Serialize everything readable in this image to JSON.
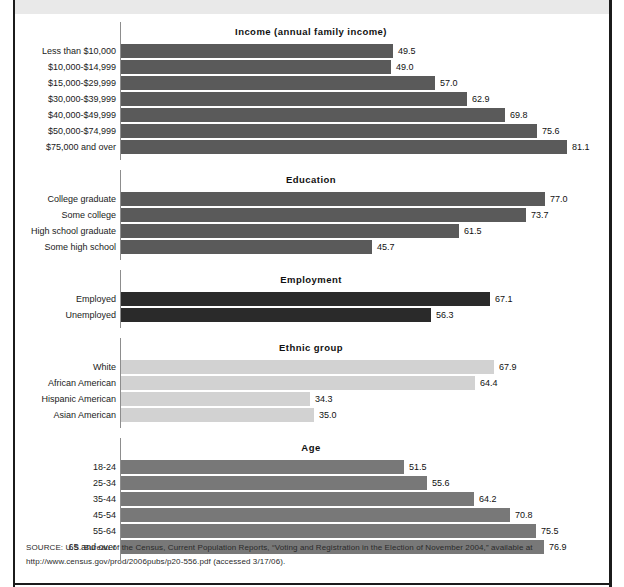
{
  "figure": {
    "top_band_text": "",
    "source": "SOURCE: U.S. Bureau of the Census, Current Population Reports, “Voting and Registration in the Election of November 2004,” available at http://www.census.gov/prod/2006pubs/p20-556.pdf (accessed 3/17/06)."
  },
  "colors": {
    "bar_income": "#5a5a5a",
    "bar_education": "#5a5a5a",
    "bar_employment": "#2a2a2a",
    "bar_ethnic": "#d2d2d2",
    "bar_age": "#787878",
    "axis": "#8d8d8d",
    "text": "#111111",
    "frame": "#1b1b1b",
    "top_band": "#e9e9e9"
  },
  "chart_data": {
    "type": "bar",
    "orientation": "horizontal",
    "title": "",
    "xlabel": "",
    "ylabel": "",
    "xlim": [
      0,
      90
    ],
    "grid": false,
    "legend": "none",
    "value_suffix": "",
    "groups": [
      {
        "name": "income",
        "title": "Income (annual family income)",
        "color": "#5a5a5a",
        "categories": [
          "Less than $10,000",
          "$10,000-$14,999",
          "$15,000-$29,999",
          "$30,000-$39,999",
          "$40,000-$49,999",
          "$50,000-$74,999",
          "$75,000 and over"
        ],
        "values": [
          49.5,
          49.0,
          57.0,
          62.9,
          69.8,
          75.6,
          81.1
        ],
        "labels": [
          "49.5",
          "49.0",
          "57.0",
          "62.9",
          "69.8",
          "75.6",
          "81.1"
        ]
      },
      {
        "name": "education",
        "title": "Education",
        "color": "#5a5a5a",
        "categories": [
          "College graduate",
          "Some college",
          "High school graduate",
          "Some high school"
        ],
        "values": [
          77.0,
          73.7,
          61.5,
          45.7
        ],
        "labels": [
          "77.0",
          "73.7",
          "61.5",
          "45.7"
        ]
      },
      {
        "name": "employment",
        "title": "Employment",
        "color": "#2a2a2a",
        "categories": [
          "Employed",
          "Unemployed"
        ],
        "values": [
          67.1,
          56.3
        ],
        "labels": [
          "67.1",
          "56.3"
        ]
      },
      {
        "name": "ethnic-group",
        "title": "Ethnic group",
        "color": "#d2d2d2",
        "categories": [
          "White",
          "African American",
          "Hispanic American",
          "Asian American"
        ],
        "values": [
          67.9,
          64.4,
          34.3,
          35.0
        ],
        "labels": [
          "67.9",
          "64.4",
          "34.3",
          "35.0"
        ]
      },
      {
        "name": "age",
        "title": "Age",
        "color": "#787878",
        "categories": [
          "18-24",
          "25-34",
          "35-44",
          "45-54",
          "55-64",
          "65 and over"
        ],
        "values": [
          51.5,
          55.6,
          64.2,
          70.8,
          75.5,
          76.9
        ],
        "labels": [
          "51.5",
          "55.6",
          "64.2",
          "70.8",
          "75.5",
          "76.9"
        ]
      }
    ]
  }
}
